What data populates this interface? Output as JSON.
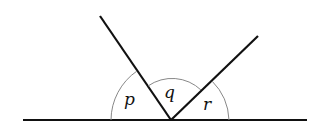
{
  "diagram": {
    "type": "angles-on-a-straight-line",
    "angle_labels": {
      "p": "p",
      "q": "q",
      "r": "r"
    },
    "colors": {
      "line": "#111111",
      "arc": "#888888",
      "background": "#ffffff"
    }
  }
}
